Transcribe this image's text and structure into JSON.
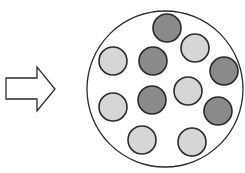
{
  "diagram": {
    "colors": {
      "background": "#ffffff",
      "stroke": "#2b2b2b",
      "dark_particle": "#8a8a8a",
      "light_particle": "#d6d6d6",
      "arrow_fill": "#ffffff"
    },
    "arrow": {
      "icon": "right-arrow-outline-icon",
      "points": "6,78 37,78 37,67 55,89 37,111 37,99 6,99"
    },
    "container": {
      "cx": 165,
      "cy": 89,
      "r": 78
    },
    "particles": [
      {
        "cx": 167,
        "cy": 28,
        "r": 14,
        "shade": "dark"
      },
      {
        "cx": 195,
        "cy": 48,
        "r": 14,
        "shade": "light"
      },
      {
        "cx": 113,
        "cy": 61,
        "r": 14,
        "shade": "light"
      },
      {
        "cx": 153,
        "cy": 61,
        "r": 14,
        "shade": "dark"
      },
      {
        "cx": 224,
        "cy": 71,
        "r": 14,
        "shade": "dark"
      },
      {
        "cx": 188,
        "cy": 91,
        "r": 14,
        "shade": "light"
      },
      {
        "cx": 152,
        "cy": 100,
        "r": 14,
        "shade": "dark"
      },
      {
        "cx": 113,
        "cy": 107,
        "r": 14,
        "shade": "light"
      },
      {
        "cx": 218,
        "cy": 111,
        "r": 14,
        "shade": "dark"
      },
      {
        "cx": 142,
        "cy": 140,
        "r": 14,
        "shade": "light"
      },
      {
        "cx": 192,
        "cy": 142,
        "r": 14,
        "shade": "light"
      }
    ],
    "counts": {
      "dark": 5,
      "light": 6,
      "total": 11
    }
  }
}
